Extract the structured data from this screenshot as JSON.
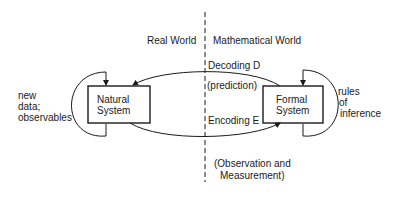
{
  "diagram": {
    "regions": {
      "left": "Real World",
      "right": "Mathematical World"
    },
    "nodes": {
      "natural_system": {
        "line1": "Natural",
        "line2": "System"
      },
      "formal_system": {
        "line1": "Formal",
        "line2": "System"
      }
    },
    "edges": {
      "decoding": {
        "label": "Decoding D",
        "sublabel": "(prediction)"
      },
      "encoding": {
        "label": "Encoding E",
        "sublabel_line1": "(Observation and",
        "sublabel_line2": "Measurement)"
      }
    },
    "loops": {
      "left": {
        "line1": "new",
        "line2": "data;",
        "line3": "observables"
      },
      "right": {
        "line1": "rules",
        "line2": "of",
        "line3": "inference"
      }
    },
    "colors": {
      "ink": "#1a1a1a",
      "background": "#ffffff"
    }
  }
}
